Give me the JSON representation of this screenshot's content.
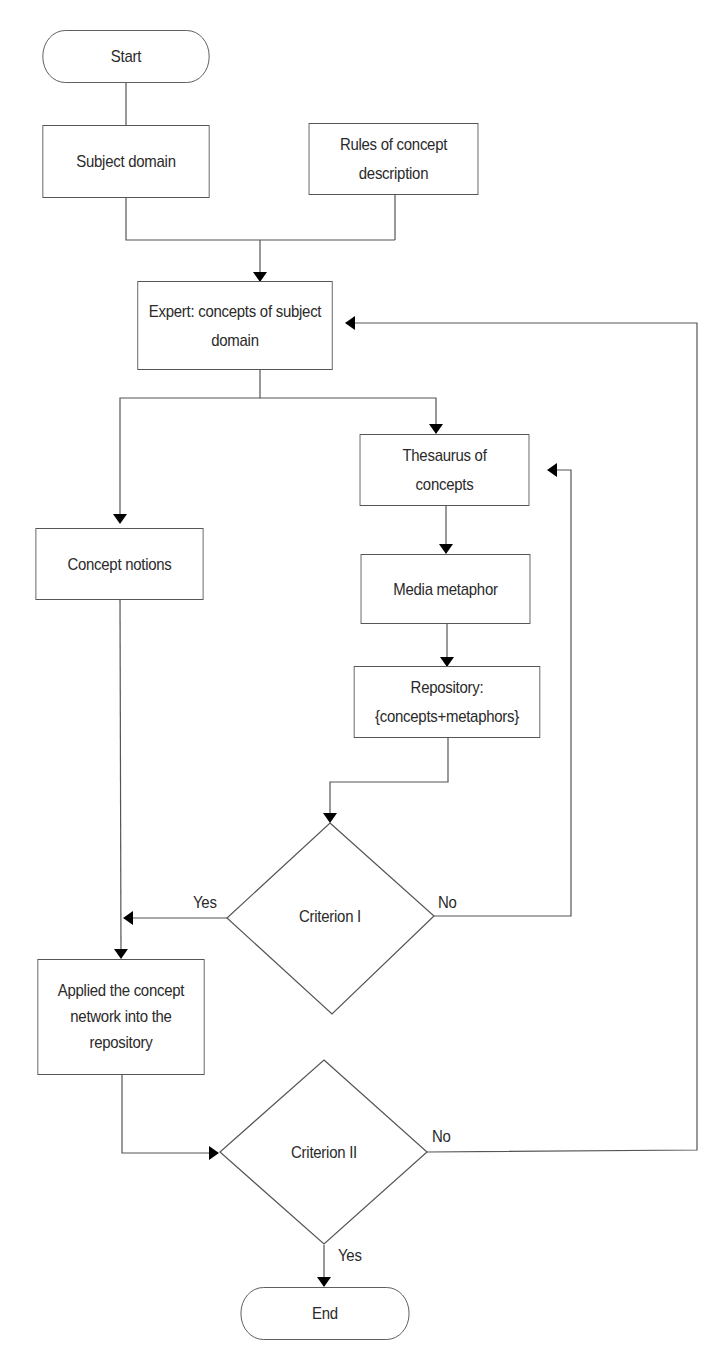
{
  "diagram": {
    "type": "flowchart",
    "nodes": {
      "start": {
        "label": "Start",
        "shape": "terminator"
      },
      "subject_domain": {
        "label": "Subject domain",
        "shape": "process"
      },
      "rules": {
        "line1": "Rules of concept",
        "line2": "description",
        "shape": "process"
      },
      "expert": {
        "line1": "Expert: concepts of subject",
        "line2": "domain",
        "shape": "process"
      },
      "thesaurus": {
        "line1": "Thesaurus of",
        "line2": "concepts",
        "shape": "process"
      },
      "concept_notions": {
        "label": "Concept notions",
        "shape": "process"
      },
      "media_metaphor": {
        "label": "Media metaphor",
        "shape": "process"
      },
      "repository": {
        "line1": "Repository:",
        "line2": "{concepts+metaphors}",
        "shape": "process"
      },
      "criterion1": {
        "label": "Criterion I",
        "shape": "decision"
      },
      "applied": {
        "line1": "Applied the concept",
        "line2": "network into the",
        "line3": "repository",
        "shape": "process"
      },
      "criterion2": {
        "label": "Criterion II",
        "shape": "decision"
      },
      "end": {
        "label": "End",
        "shape": "terminator"
      }
    },
    "edge_labels": {
      "c1_yes": "Yes",
      "c1_no": "No",
      "c2_no": "No",
      "c2_yes": "Yes"
    },
    "edges": [
      {
        "from": "start",
        "to": "subject_domain"
      },
      {
        "from": "subject_domain",
        "to": "expert"
      },
      {
        "from": "rules",
        "to": "expert"
      },
      {
        "from": "expert",
        "to": "concept_notions"
      },
      {
        "from": "expert",
        "to": "thesaurus"
      },
      {
        "from": "thesaurus",
        "to": "media_metaphor"
      },
      {
        "from": "media_metaphor",
        "to": "repository"
      },
      {
        "from": "repository",
        "to": "criterion1"
      },
      {
        "from": "criterion1",
        "to": "applied",
        "label": "Yes"
      },
      {
        "from": "criterion1",
        "to": "thesaurus",
        "label": "No"
      },
      {
        "from": "concept_notions",
        "to": "applied"
      },
      {
        "from": "applied",
        "to": "criterion2"
      },
      {
        "from": "criterion2",
        "to": "expert",
        "label": "No"
      },
      {
        "from": "criterion2",
        "to": "end",
        "label": "Yes"
      }
    ],
    "colors": {
      "line": "#555555",
      "arrow": "#000000",
      "text": "#2a2a2a",
      "background": "#ffffff"
    }
  }
}
